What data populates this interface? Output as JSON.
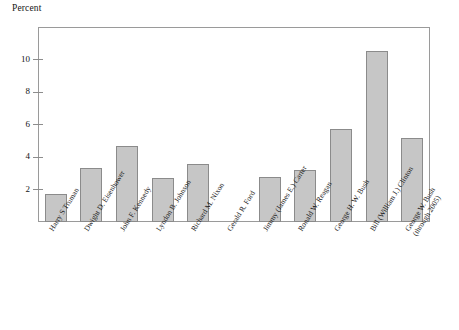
{
  "chart_data": {
    "type": "bar",
    "title": "",
    "subtitle": "",
    "ylabel": "Percent",
    "xlabel": "",
    "ylim": [
      0,
      12
    ],
    "yticks": [
      2,
      4,
      6,
      8,
      10
    ],
    "ytick_labels": [
      "2",
      "4",
      "6",
      "8",
      "10"
    ],
    "grid": false,
    "legend": "none",
    "bar_fill_color": "#c6c6c6",
    "bar_edge_color": "#8b8b8b",
    "frame_color": "#9a9a9a",
    "categories": [
      "Harry S Truman",
      "Dwight D. Eisenhower",
      "John F. Kennedy",
      "Lyndon B. Johnson",
      "Richard M. Nixon",
      "Gerald R. Ford",
      "Jimmy (James E.) Carter",
      "Ronald W. Reagan",
      "George H. W. Bush",
      "Bill (William J.) Clinton",
      "George W. Bush (through 2005)"
    ],
    "category_lines": [
      [
        "Harry S Truman"
      ],
      [
        "Dwight D. Eisenhower"
      ],
      [
        "John F. Kennedy"
      ],
      [
        "Lyndon B. Johnson"
      ],
      [
        "Richard M. Nixon"
      ],
      [
        "Gerald R. Ford"
      ],
      [
        "Jimmy (James E.) Carter"
      ],
      [
        "Ronald W. Reagan"
      ],
      [
        "George H. W. Bush"
      ],
      [
        "Bill (William J.) Clinton"
      ],
      [
        "George W. Bush",
        "(through 2005)"
      ]
    ],
    "values": [
      1.7,
      3.3,
      4.65,
      2.7,
      3.55,
      0,
      2.8,
      3.2,
      5.75,
      10.55,
      5.15
    ]
  },
  "axis": {
    "y_title": "Percent"
  }
}
